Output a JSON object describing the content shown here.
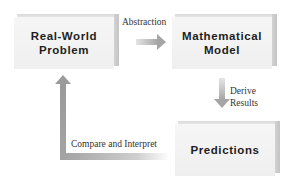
{
  "diagram": {
    "nodes": [
      {
        "id": "real-world",
        "line1": "Real-World",
        "line2": "Problem"
      },
      {
        "id": "model",
        "line1": "Mathematical",
        "line2": "Model"
      },
      {
        "id": "predictions",
        "line1": "Predictions",
        "line2": ""
      }
    ],
    "edges": [
      {
        "from": "real-world",
        "to": "model",
        "label": "Abstraction"
      },
      {
        "from": "model",
        "to": "predictions",
        "label_line1": "Derive",
        "label_line2": "Results"
      },
      {
        "from": "predictions",
        "to": "real-world",
        "label": "Compare and Interpret"
      }
    ],
    "colors": {
      "box_face": "#f2f2f2",
      "box_side": "#c8c8c8",
      "arrow": "#a8a8a8",
      "text": "#1e1e1e"
    }
  }
}
